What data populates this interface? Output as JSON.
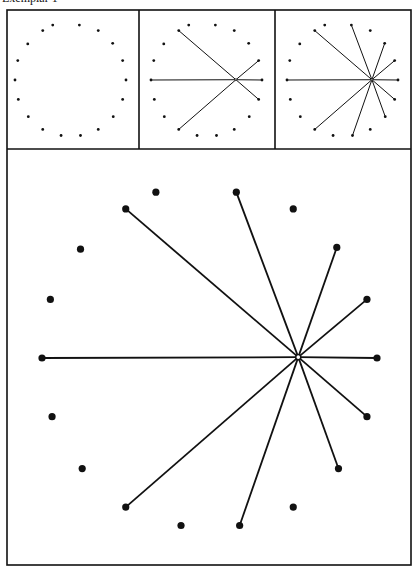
{
  "caption": "Exemplar 1",
  "colors": {
    "ink": "#111111",
    "background": "#ffffff"
  },
  "frame": {
    "outer": {
      "x": 7,
      "y": 10,
      "x2": 411,
      "y2": 565
    },
    "top_row_bottom": 149,
    "dividers_x": [
      139,
      275
    ]
  },
  "ring_unit_points": [
    [
      -0.32,
      -0.99
    ],
    [
      0.16,
      -0.99
    ],
    [
      -0.5,
      -0.89
    ],
    [
      0.5,
      -0.89
    ],
    [
      -0.77,
      -0.65
    ],
    [
      0.76,
      -0.66
    ],
    [
      -0.95,
      -0.35
    ],
    [
      0.94,
      -0.35
    ],
    [
      -1.0,
      0.0
    ],
    [
      1.0,
      0.0
    ],
    [
      -0.94,
      0.35
    ],
    [
      0.94,
      0.35
    ],
    [
      -0.76,
      0.66
    ],
    [
      0.77,
      0.66
    ],
    [
      -0.5,
      0.89
    ],
    [
      0.5,
      0.89
    ],
    [
      -0.17,
      1.0
    ],
    [
      0.18,
      1.0
    ]
  ],
  "hub_unit": [
    0.53,
    -0.005
  ],
  "panels": [
    {
      "name": "panel-1-dots-only",
      "center": [
        70.5,
        80
      ],
      "radius": 55.5,
      "dot_radius": 1.4,
      "stroke": 1,
      "show_hub": false,
      "lines_to": []
    },
    {
      "name": "panel-2-six-lines",
      "center": [
        206.5,
        80
      ],
      "radius": 55.5,
      "dot_radius": 1.4,
      "stroke": 1,
      "show_hub": true,
      "lines_to": [
        2,
        7,
        8,
        9,
        11,
        14
      ]
    },
    {
      "name": "panel-3-ten-lines",
      "center": [
        342.5,
        80
      ],
      "radius": 55.5,
      "dot_radius": 1.4,
      "stroke": 1,
      "show_hub": true,
      "lines_to": [
        1,
        2,
        5,
        7,
        8,
        9,
        11,
        13,
        14,
        17
      ]
    },
    {
      "name": "panel-4-large-ten-lines",
      "center": [
        209.5,
        358
      ],
      "radius": 167.5,
      "dot_radius": 3.6,
      "stroke": 1.8,
      "show_hub": true,
      "lines_to": [
        1,
        2,
        5,
        7,
        8,
        9,
        11,
        13,
        14,
        17
      ]
    }
  ]
}
